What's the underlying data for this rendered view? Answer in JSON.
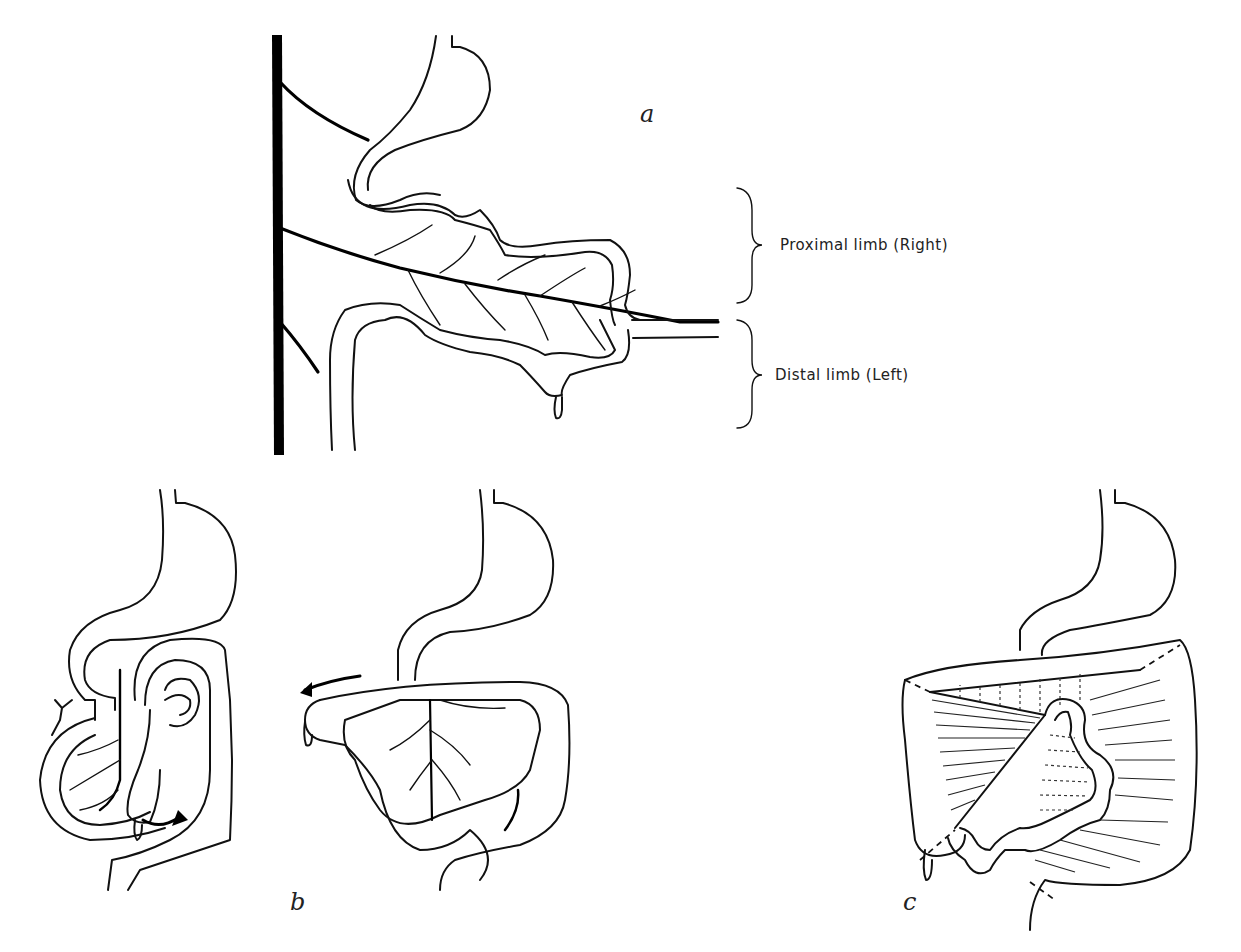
{
  "panels": {
    "a": {
      "label": "a",
      "annotations": {
        "proximal": "Proximal limb (Right)",
        "distal": "Distal limb (Left)"
      }
    },
    "b": {
      "label": "b"
    },
    "c": {
      "label": "c"
    }
  },
  "colors": {
    "ink": "#111111",
    "background": "#ffffff"
  }
}
